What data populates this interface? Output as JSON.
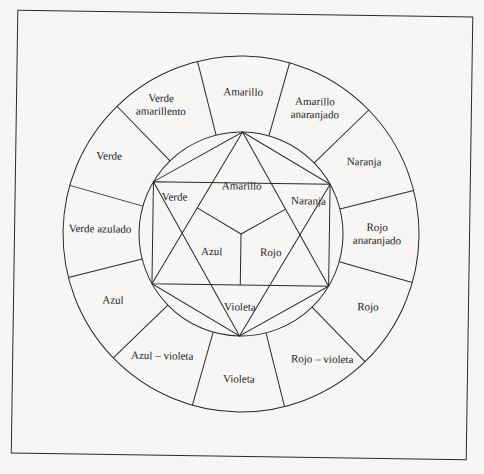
{
  "diagram": {
    "type": "color-wheel",
    "colors": {
      "line": "#2a2a2a",
      "text": "#1e1e1e",
      "paper": "#f7f6f4"
    },
    "outer_ring": [
      {
        "label": "Amarillo",
        "x": 241,
        "y": 92
      },
      {
        "label": "Amarillo\nanaranjado",
        "line1": "Amarillo",
        "line2": "anaranjado",
        "x": 313,
        "y": 107
      },
      {
        "label": "Naranja",
        "x": 363,
        "y": 160
      },
      {
        "label": "Rojo\nanaranjado",
        "line1": "Rojo",
        "line2": "anaranjado",
        "x": 377,
        "y": 232
      },
      {
        "label": "Rojo",
        "x": 369,
        "y": 305
      },
      {
        "label": "Rojo – violeta",
        "x": 324,
        "y": 358
      },
      {
        "label": "Violeta",
        "x": 241,
        "y": 379
      },
      {
        "label": "Azul – violeta",
        "x": 164,
        "y": 357
      },
      {
        "label": "Azul",
        "x": 114,
        "y": 302
      },
      {
        "label": "Verde azulado",
        "x": 100,
        "y": 231
      },
      {
        "label": "Verde",
        "x": 108,
        "y": 158
      },
      {
        "label": "Verde\namarillento",
        "line1": "Verde",
        "line2": "amarillento",
        "x": 159,
        "y": 106
      }
    ],
    "inner_primary_triangle": [
      {
        "label": "Amarillo",
        "x": 241,
        "y": 186
      },
      {
        "label": "Azul",
        "x": 212,
        "y": 252
      },
      {
        "label": "Rojo",
        "x": 271,
        "y": 252
      }
    ],
    "inner_secondary": [
      {
        "label": "Verde",
        "x": 174,
        "y": 198
      },
      {
        "label": "Naranja",
        "x": 308,
        "y": 200
      },
      {
        "label": "Violeta",
        "x": 241,
        "y": 307
      }
    ]
  }
}
